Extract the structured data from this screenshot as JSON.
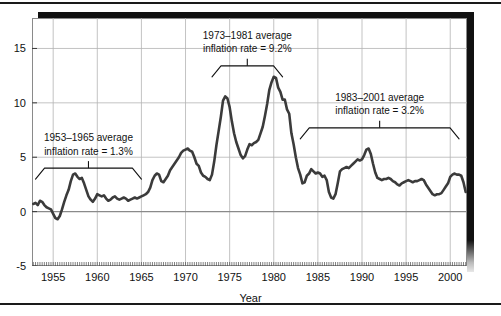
{
  "chart_data": {
    "type": "line",
    "title": "",
    "xlabel": "Year",
    "ylabel": "",
    "xlim": [
      1952.6,
      2001.9
    ],
    "ylim": [
      -5,
      17.8
    ],
    "grid": true,
    "legend_position": "none",
    "line_color": "#3b3b3b",
    "gridline_color": "#b4b4b4",
    "zeroline_color": "#8a8a8a",
    "xticks": [
      1955,
      1960,
      1965,
      1970,
      1975,
      1980,
      1985,
      1990,
      1995,
      2000
    ],
    "xtick_labels": [
      "1955",
      "1960",
      "1965",
      "1970",
      "1975",
      "1980",
      "1985",
      "1990",
      "1995",
      "2000"
    ],
    "yticks": [
      -5,
      0,
      5,
      10,
      15
    ],
    "ytick_labels": [
      "-5",
      "0",
      "5",
      "10",
      "15"
    ],
    "minor_xtick_interval": 0.25,
    "series": [
      {
        "name": "Inflation rate",
        "x": [
          1952.75,
          1953.0,
          1953.25,
          1953.5,
          1953.75,
          1954.0,
          1954.25,
          1954.5,
          1954.75,
          1955.0,
          1955.25,
          1955.5,
          1955.75,
          1956.0,
          1956.25,
          1956.5,
          1956.75,
          1957.0,
          1957.25,
          1957.5,
          1957.75,
          1958.0,
          1958.25,
          1958.5,
          1958.75,
          1959.0,
          1959.25,
          1959.5,
          1959.75,
          1960.0,
          1960.25,
          1960.5,
          1960.75,
          1961.0,
          1961.25,
          1961.5,
          1961.75,
          1962.0,
          1962.25,
          1962.5,
          1962.75,
          1963.0,
          1963.25,
          1963.5,
          1963.75,
          1964.0,
          1964.25,
          1964.5,
          1964.75,
          1965.0,
          1965.25,
          1965.5,
          1965.75,
          1966.0,
          1966.25,
          1966.5,
          1966.75,
          1967.0,
          1967.25,
          1967.5,
          1967.75,
          1968.0,
          1968.25,
          1968.5,
          1968.75,
          1969.0,
          1969.25,
          1969.5,
          1969.75,
          1970.0,
          1970.25,
          1970.5,
          1970.75,
          1971.0,
          1971.25,
          1971.5,
          1971.75,
          1972.0,
          1972.25,
          1972.5,
          1972.75,
          1973.0,
          1973.25,
          1973.5,
          1973.75,
          1974.0,
          1974.25,
          1974.5,
          1974.75,
          1975.0,
          1975.25,
          1975.5,
          1975.75,
          1976.0,
          1976.25,
          1976.5,
          1976.75,
          1977.0,
          1977.25,
          1977.5,
          1977.75,
          1978.0,
          1978.25,
          1978.5,
          1978.75,
          1979.0,
          1979.25,
          1979.5,
          1979.75,
          1980.0,
          1980.25,
          1980.5,
          1980.75,
          1981.0,
          1981.25,
          1981.5,
          1981.75,
          1982.0,
          1982.25,
          1982.5,
          1982.75,
          1983.0,
          1983.25,
          1983.5,
          1983.75,
          1984.0,
          1984.25,
          1984.5,
          1984.75,
          1985.0,
          1985.25,
          1985.5,
          1985.75,
          1986.0,
          1986.25,
          1986.5,
          1986.75,
          1987.0,
          1987.25,
          1987.5,
          1987.75,
          1988.0,
          1988.25,
          1988.5,
          1988.75,
          1989.0,
          1989.25,
          1989.5,
          1989.75,
          1990.0,
          1990.25,
          1990.5,
          1990.75,
          1991.0,
          1991.25,
          1991.5,
          1991.75,
          1992.0,
          1992.25,
          1992.5,
          1992.75,
          1993.0,
          1993.25,
          1993.5,
          1993.75,
          1994.0,
          1994.25,
          1994.5,
          1994.75,
          1995.0,
          1995.25,
          1995.5,
          1995.75,
          1996.0,
          1996.25,
          1996.5,
          1996.75,
          1997.0,
          1997.25,
          1997.5,
          1997.75,
          1998.0,
          1998.25,
          1998.5,
          1998.75,
          1999.0,
          1999.25,
          1999.5,
          1999.75,
          2000.0,
          2000.25,
          2000.5,
          2000.75,
          2001.0,
          2001.25,
          2001.5,
          2001.75
        ],
        "values": [
          0.7,
          0.8,
          0.6,
          1.0,
          0.9,
          0.6,
          0.4,
          0.3,
          0.2,
          -0.2,
          -0.6,
          -0.7,
          -0.4,
          0.2,
          0.9,
          1.5,
          2.0,
          2.8,
          3.4,
          3.5,
          3.2,
          3.0,
          3.1,
          2.6,
          2.0,
          1.4,
          1.1,
          0.9,
          1.2,
          1.6,
          1.5,
          1.4,
          1.5,
          1.2,
          1.0,
          1.1,
          1.3,
          1.4,
          1.2,
          1.1,
          1.2,
          1.3,
          1.2,
          1.0,
          1.1,
          1.2,
          1.3,
          1.2,
          1.3,
          1.4,
          1.5,
          1.6,
          1.8,
          2.2,
          2.9,
          3.3,
          3.5,
          3.4,
          2.8,
          2.7,
          3.0,
          3.3,
          3.8,
          4.1,
          4.4,
          4.7,
          5.0,
          5.4,
          5.6,
          5.7,
          5.8,
          5.6,
          5.5,
          5.0,
          4.4,
          4.2,
          3.6,
          3.3,
          3.2,
          3.0,
          2.9,
          3.4,
          4.6,
          6.1,
          7.4,
          8.7,
          10.2,
          10.6,
          10.4,
          9.6,
          8.3,
          7.2,
          6.4,
          5.8,
          5.2,
          4.9,
          5.1,
          5.7,
          6.2,
          6.1,
          6.3,
          6.4,
          6.6,
          7.2,
          7.8,
          8.8,
          9.9,
          11.2,
          11.9,
          12.4,
          12.3,
          11.4,
          11.0,
          10.3,
          10.3,
          9.4,
          9.0,
          7.2,
          6.2,
          5.0,
          4.0,
          3.4,
          2.6,
          2.7,
          3.3,
          3.5,
          3.9,
          3.7,
          3.5,
          3.6,
          3.5,
          3.2,
          3.3,
          2.9,
          1.8,
          1.3,
          1.2,
          1.6,
          2.6,
          3.7,
          3.9,
          4.0,
          4.1,
          4.0,
          4.2,
          4.4,
          4.6,
          4.8,
          4.7,
          4.8,
          5.2,
          5.7,
          5.8,
          5.3,
          4.4,
          3.6,
          3.1,
          3.0,
          2.9,
          3.0,
          3.0,
          3.1,
          3.0,
          2.8,
          2.7,
          2.5,
          2.4,
          2.6,
          2.7,
          2.8,
          2.9,
          2.8,
          2.7,
          2.8,
          2.8,
          2.9,
          3.0,
          2.9,
          2.5,
          2.2,
          1.9,
          1.6,
          1.5,
          1.6,
          1.6,
          1.7,
          2.0,
          2.3,
          2.6,
          3.2,
          3.4,
          3.5,
          3.4,
          3.4,
          3.3,
          2.7,
          1.8
        ]
      }
    ],
    "annotations": [
      {
        "id": "annotation-1953-1965",
        "line1": "1953–1965 average",
        "line2": "inflation rate = 1.3%",
        "value": 1.3,
        "period_start": 1953,
        "period_end": 1965,
        "bracket_y": 4.0,
        "label_center_x": 1959.0
      },
      {
        "id": "annotation-1973-1981",
        "line1": "1973–1981 average",
        "line2": "inflation rate = 9.2%",
        "value": 9.2,
        "period_start": 1973,
        "period_end": 1981,
        "bracket_y": 13.4,
        "label_center_x": 1977.0
      },
      {
        "id": "annotation-1983-2001",
        "line1": "1983–2001 average",
        "line2": "inflation rate = 3.2%",
        "value": 3.2,
        "period_start": 1983,
        "period_end": 2001,
        "bracket_y": 7.7,
        "label_center_x": 1992.0
      }
    ]
  }
}
